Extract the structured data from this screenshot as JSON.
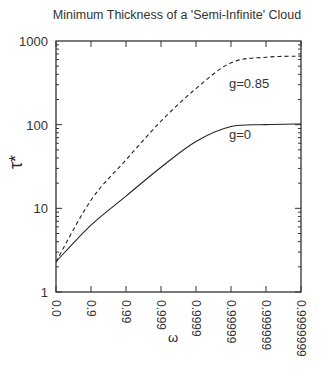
{
  "chart_data": {
    "type": "line",
    "title": "Minimum Thickness of a 'Semi-Infinite' Cloud",
    "xlabel": "ω",
    "ylabel": "τ*",
    "yscale": "log",
    "ylim": [
      1,
      1000
    ],
    "grid": false,
    "legend_position": "inline labels",
    "categories": [
      "0.0",
      "0.9",
      "0.99",
      "0.999",
      "0.9999",
      "0.99999",
      "0.999999",
      "0.9999999"
    ],
    "y_ticks": [
      "1",
      "10",
      "100",
      "1000"
    ],
    "series": [
      {
        "name": "g=0",
        "style": "solid",
        "values": [
          2.3,
          6.3,
          14,
          31,
          63,
          95,
          100,
          102
        ]
      },
      {
        "name": "g=0.85",
        "style": "dashed",
        "values": [
          2.3,
          12.5,
          38,
          110,
          270,
          550,
          640,
          660
        ]
      }
    ]
  }
}
